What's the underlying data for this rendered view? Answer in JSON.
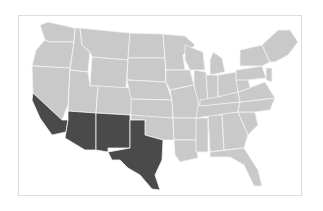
{
  "map": {
    "title": "",
    "colors": {
      "highlighted": "#4a4a4a",
      "default": "#c9c9c9",
      "border": "#f4f4f4",
      "frame": "#dcdcdc"
    },
    "highlighted_states": [
      "California",
      "Arizona",
      "New Mexico",
      "Texas"
    ]
  }
}
